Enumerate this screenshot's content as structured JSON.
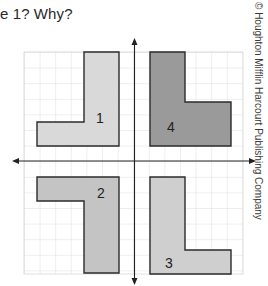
{
  "question": {
    "text": "e 1? Why?"
  },
  "copyright": {
    "text": "© Houghton Mifflin Harcourt Publishing Company"
  },
  "grid": {
    "cell_size_px": 15.6,
    "line_color": "#d4d4d4",
    "axis_color": "#222222"
  },
  "shapes": [
    {
      "id": "1",
      "label": "1",
      "fill": "#d9d9d9",
      "quadrant": "top-left"
    },
    {
      "id": "4",
      "label": "4",
      "fill": "#9a9a9a",
      "quadrant": "top-right"
    },
    {
      "id": "2",
      "label": "2",
      "fill": "#c4c4c4",
      "quadrant": "bottom-left"
    },
    {
      "id": "3",
      "label": "3",
      "fill": "#cfcfcf",
      "quadrant": "bottom-right"
    }
  ]
}
